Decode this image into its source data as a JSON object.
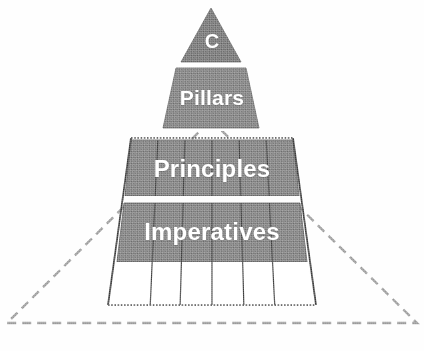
{
  "diagram": {
    "type": "pyramid",
    "title": "",
    "orientation": "apex-up",
    "tier_count": 5,
    "column_divider_count": 5,
    "column_count": 6,
    "colors": {
      "fill_gray": "#7b7b7b",
      "apex_gray": "#6f6f6f",
      "label_text": "#ffffff",
      "outline_solid": "#3b3b3b",
      "outline_dashed": "#8e8e8e",
      "background": "#fefefe"
    },
    "tiers": [
      {
        "name": "capstone",
        "label": "C",
        "filled": true,
        "shape": "triangle",
        "inside_dashed_boundary": false
      },
      {
        "name": "pillars",
        "label": "Pillars",
        "filled": true,
        "shape": "trapezoid",
        "inside_dashed_boundary": false
      },
      {
        "name": "principles",
        "label": "Principles",
        "filled": true,
        "shape": "trapezoid",
        "inside_dashed_boundary": true
      },
      {
        "name": "imperatives",
        "label": "Imperatives",
        "filled": true,
        "shape": "trapezoid",
        "inside_dashed_boundary": true
      },
      {
        "name": "base",
        "label": "",
        "filled": false,
        "shape": "trapezoid",
        "inside_dashed_boundary": true
      }
    ],
    "annotations": {
      "dashed_outline_encloses": [
        "principles",
        "imperatives",
        "base"
      ]
    }
  }
}
